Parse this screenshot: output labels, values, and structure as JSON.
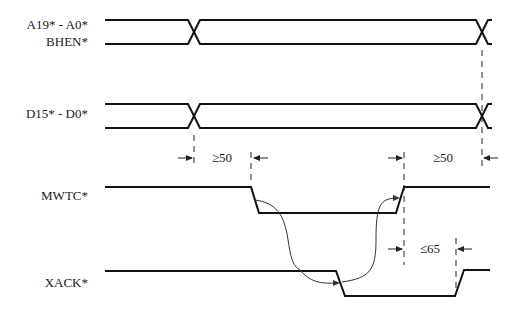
{
  "diagram": {
    "type": "timing-diagram",
    "signals": [
      {
        "id": "addr",
        "label_line1": "A19* - A0*",
        "label_line2": "BHEN*",
        "kind": "bus"
      },
      {
        "id": "data",
        "label_line1": "D15* - D0*",
        "kind": "bus"
      },
      {
        "id": "mwtc",
        "label_line1": "MWTC*",
        "kind": "digital"
      },
      {
        "id": "xack",
        "label_line1": "XACK*",
        "kind": "digital"
      }
    ],
    "timing_annotations": [
      {
        "id": "setup",
        "label": "≥50",
        "between": [
          "data-valid",
          "MWTC* falling"
        ]
      },
      {
        "id": "hold",
        "label": "≥50",
        "between": [
          "MWTC* rising",
          "data-invalid"
        ]
      },
      {
        "id": "xack_release",
        "label": "≤65",
        "between": [
          "MWTC* rising",
          "XACK* rising"
        ]
      }
    ],
    "colors": {
      "line": "#111111",
      "background": "#ffffff"
    }
  }
}
